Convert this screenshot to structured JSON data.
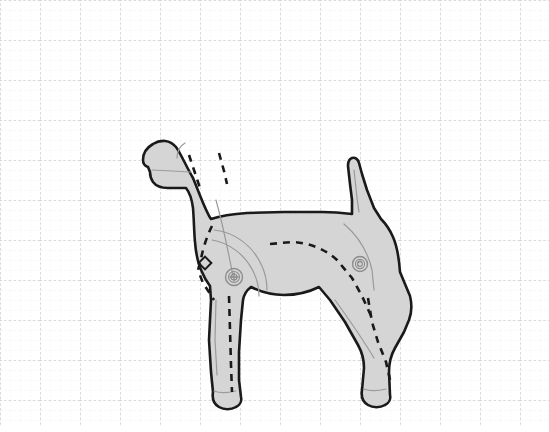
{
  "document": {
    "title": "Dog Figure Technical Drawing",
    "subject": "dog",
    "description": "Side-view technical illustration of a jointed artist's mannequin dog on dotted graph paper",
    "alt_text": "Line drawing of a dog in profile facing left, filled light gray, with dashed construction seams, two circular pivot joints at shoulder and hip, and a small diamond marker on the chest"
  },
  "canvas": {
    "width": 549,
    "height": 432,
    "background_color": "#ffffff"
  },
  "grid": {
    "name": "dotted-graph-paper",
    "minor_spacing_px": 10,
    "major_spacing_px": 40,
    "minor_color": "#e2e2e2",
    "major_color": "#b6b6b6",
    "dash_pattern": "2,2",
    "visible": true,
    "origin_x": 0,
    "origin_y": 0,
    "major_columns": 14,
    "major_rows": 11
  },
  "figure": {
    "name": "dog-figure",
    "fill_color": "#d5d5d5",
    "outline_color": "#1a1a1a",
    "outline_width_px": 2.6,
    "detail_line_color": "#9a9a9a",
    "detail_line_width_px": 1.2,
    "seam_color": "#1a1a1a",
    "seam_width_px": 2.6,
    "seam_dash": "7,6",
    "bounding_box": {
      "x": 142,
      "y": 128,
      "width": 258,
      "height": 288
    },
    "parts": [
      {
        "name": "head",
        "label": "Head"
      },
      {
        "name": "muzzle",
        "label": "Muzzle"
      },
      {
        "name": "ear",
        "label": "Ear"
      },
      {
        "name": "neck",
        "label": "Neck"
      },
      {
        "name": "chest",
        "label": "Chest"
      },
      {
        "name": "shoulder",
        "label": "Shoulder"
      },
      {
        "name": "body",
        "label": "Body"
      },
      {
        "name": "haunch",
        "label": "Haunch"
      },
      {
        "name": "tail",
        "label": "Tail"
      },
      {
        "name": "front-leg-near",
        "label": "Front leg (near)"
      },
      {
        "name": "front-leg-far",
        "label": "Front leg (far)"
      },
      {
        "name": "rear-leg-near",
        "label": "Rear leg (near)"
      },
      {
        "name": "rear-leg-far",
        "label": "Rear leg (far)"
      },
      {
        "name": "paw",
        "label": "Paw"
      }
    ]
  },
  "joints": [
    {
      "name": "shoulder-joint",
      "label": "Shoulder pivot",
      "cx": 234,
      "cy": 277,
      "outer_r": 8.5,
      "mid_r": 5.5,
      "inner_r": 3.0,
      "marker": "plus",
      "color": "#8c8c8c"
    },
    {
      "name": "hip-joint",
      "label": "Hip pivot",
      "cx": 360,
      "cy": 264,
      "outer_r": 7.5,
      "mid_r": 4.6,
      "inner_r": 2.4,
      "marker": "swirl",
      "color": "#8c8c8c"
    }
  ],
  "markers": [
    {
      "name": "chest-diamond-marker",
      "label": "Chest alignment marker",
      "cx": 205,
      "cy": 263,
      "size": 9,
      "rotation_deg": 45,
      "stroke": "#1a1a1a"
    }
  ],
  "paths": {
    "body_outline": "M 193 178 C 186 166 180 152 176 147 C 170 140 161 139 153 144 C 146 148 143 154 143 160 C 143 163 145 166 148 167 L 150 172 C 150 176 151 179 153 182 C 156 186 161 188 168 188 L 186 188 C 190 193 192 200 193 208 C 194 220 194 232 195 242 C 196 254 198 264 202 272 C 204 277 207 282 210 286 L 211 300 L 209 340 L 211 372 L 213 392 C 212 398 214 404 219 407 C 224 410 231 410 236 407 C 240 405 242 401 241 397 L 239 380 L 239 352 L 241 320 L 243 300 C 244 294 247 290 251 287 C 261 292 272 295 284 295 C 297 295 309 292 319 287 L 330 300 L 345 322 L 358 345 C 362 352 364 360 364 368 L 362 390 C 361 396 363 402 368 405 C 373 408 380 408 385 405 C 389 403 391 399 390 395 L 389 372 C 389 363 391 355 395 348 L 404 332 L 409 320 C 412 312 412 304 410 296 L 400 272 C 399 258 397 246 393 237 C 390 230 386 224 381 219 L 374 208 L 367 190 L 362 174 L 359 163 C 358 159 355 157 352 158 C 349 159 348 162 348 166 L 350 184 L 352 200 L 352 214 C 344 213 334 212 322 212 L 284 212 L 247 213 C 232 214 220 216 211 219 C 206 212 200 195 193 178 Z",
    "seam_head_1": "M 189 155 L 196 176 L 201 191",
    "seam_head_2": "M 219 153 L 224 171 L 227 184",
    "seam_chest": "M 212 226 C 207 236 203 248 201 259 L 198 270 L 203 283 L 214 300",
    "seam_back": "M 270 244 L 292 242 C 310 243 325 249 337 260 L 352 278 L 362 296 L 372 318",
    "seam_front_leg": "M 229 296 L 230 330 L 231 365 L 232 392",
    "seam_rear_leg": "M 368 298 L 372 322 L 378 342 L 386 362 L 391 384",
    "detail_muzzle": "M 152 170 L 191 172",
    "detail_ear": "M 185 143 C 180 146 177 152 177 158",
    "detail_neck": "M 216 200 C 222 222 228 250 233 276",
    "detail_shoulder_arc": "M 214 230 C 234 232 252 245 261 264 C 265 272 267 281 267 290",
    "detail_shoulder_arc2": "M 212 240 C 230 243 245 255 253 271 C 257 279 259 288 259 296",
    "detail_haunch": "M 344 224 C 358 236 368 252 372 270 L 374 290",
    "detail_tail": "M 354 170 L 357 198 L 359 212",
    "detail_rear_leg": "M 335 300 C 348 318 362 338 374 358",
    "detail_front_leg": "M 216 300 L 215 340 L 217 375",
    "detail_foot_front": "M 214 391 C 219 393 228 393 236 391",
    "detail_foot_rear": "M 364 389 C 369 391 378 391 386 389"
  }
}
